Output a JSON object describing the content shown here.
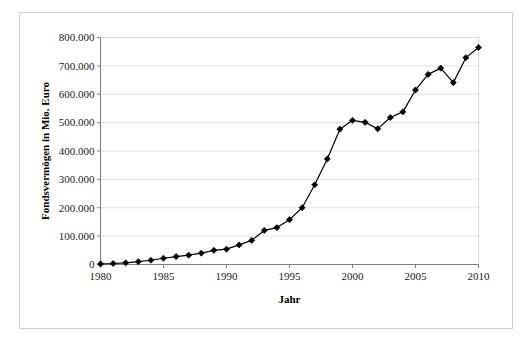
{
  "chart_data": {
    "type": "line",
    "title": "",
    "xlabel": "Jahr",
    "ylabel": "Fondsvermögen in Mio. Euro",
    "xlim": [
      1980,
      2010
    ],
    "ylim": [
      0,
      800000
    ],
    "grid": "horizontal",
    "legend": "none",
    "marker": "diamond",
    "line_color": "#000000",
    "marker_color": "#000000",
    "x": [
      1980,
      1981,
      1982,
      1983,
      1984,
      1985,
      1986,
      1987,
      1988,
      1989,
      1990,
      1991,
      1992,
      1993,
      1994,
      1995,
      1996,
      1997,
      1998,
      1999,
      2000,
      2001,
      2002,
      2003,
      2004,
      2005,
      2006,
      2007,
      2008,
      2009,
      2010
    ],
    "values": [
      2000,
      3500,
      6000,
      10000,
      15000,
      22000,
      28000,
      33000,
      40000,
      50000,
      54000,
      69000,
      85000,
      120000,
      130000,
      158000,
      200000,
      281000,
      372000,
      477000,
      508000,
      501000,
      478000,
      518000,
      538000,
      615000,
      670000,
      692000,
      641000,
      729000,
      765000
    ],
    "x_tick_labels": [
      "1980",
      "1985",
      "1990",
      "1995",
      "2000",
      "2005",
      "2010"
    ],
    "x_ticks": [
      1980,
      1985,
      1990,
      1995,
      2000,
      2005,
      2010
    ],
    "y_tick_labels": [
      "0",
      "100.000",
      "200.000",
      "300.000",
      "400.000",
      "500.000",
      "600.000",
      "700.000",
      "800.000"
    ],
    "y_ticks": [
      0,
      100000,
      200000,
      300000,
      400000,
      500000,
      600000,
      700000,
      800000
    ],
    "gridline_color": "#d9d9d9",
    "axis_color": "#808080",
    "frame_color": "#cfcfcf"
  }
}
